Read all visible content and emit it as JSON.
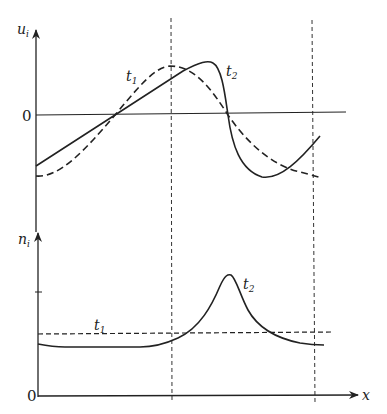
{
  "figure": {
    "top_panel": {
      "y_axis_label": "u",
      "y_axis_subscript": "i",
      "origin_label": "0",
      "curves": [
        {
          "name": "t1",
          "label": "t",
          "subscript": "1",
          "style": "dashed"
        },
        {
          "name": "t2",
          "label": "t",
          "subscript": "2",
          "style": "solid"
        }
      ]
    },
    "bottom_panel": {
      "y_axis_label": "n",
      "y_axis_subscript": "i",
      "origin_label": "0",
      "x_axis_label": "x",
      "curves": [
        {
          "name": "t1",
          "label": "t",
          "subscript": "1",
          "style": "dashed"
        },
        {
          "name": "t2",
          "label": "t",
          "subscript": "2",
          "style": "solid"
        }
      ]
    },
    "vertical_markers": [
      "dashed line at left boundary of region",
      "dashed line at right boundary of region"
    ]
  }
}
